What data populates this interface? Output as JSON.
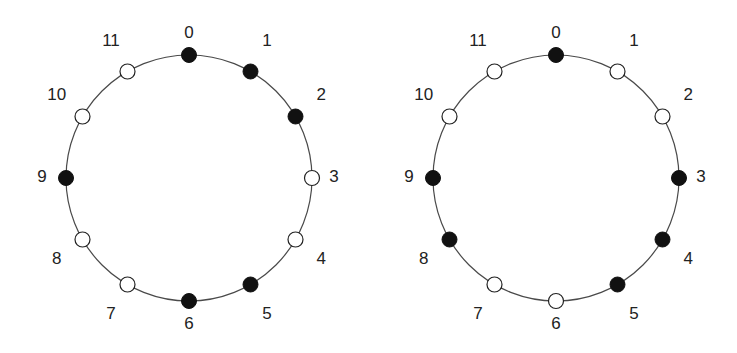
{
  "diagrams": [
    {
      "name": "left-circle",
      "positions": [
        "0",
        "1",
        "2",
        "3",
        "4",
        "5",
        "6",
        "7",
        "8",
        "9",
        "10",
        "11"
      ],
      "filled": [
        0,
        1,
        2,
        5,
        6,
        9
      ],
      "open": [
        3,
        4,
        7,
        8,
        10,
        11
      ]
    },
    {
      "name": "right-circle",
      "positions": [
        "0",
        "1",
        "2",
        "3",
        "4",
        "5",
        "6",
        "7",
        "8",
        "9",
        "10",
        "11"
      ],
      "filled": [
        0,
        3,
        4,
        5,
        8,
        9
      ],
      "open": [
        1,
        2,
        6,
        7,
        10,
        11
      ]
    }
  ],
  "colors": {
    "filled": "#111111",
    "open": "#ffffff",
    "line": "#4a4a4a"
  }
}
